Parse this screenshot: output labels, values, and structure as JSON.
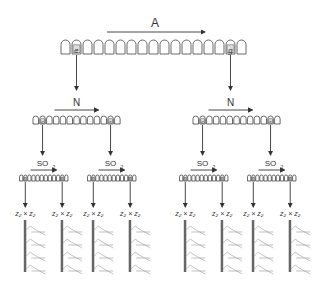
{
  "diagram": {
    "type": "hierarchical cleavage scheme",
    "levels": [
      {
        "id": "level-1",
        "enzyme_label": "A",
        "rows": [
          {
            "id": "top-row",
            "cell_count": 17,
            "marked_cells": [
              {
                "index": 1,
                "label": "e"
              },
              {
                "index": 15,
                "label": "g"
              }
            ]
          }
        ]
      },
      {
        "id": "level-2",
        "enzyme_label": "N",
        "rows": [
          {
            "id": "mid-left-row",
            "cell_count": 13,
            "marked_cells": [
              {
                "index": 1,
                "label": "e"
              },
              {
                "index": 11,
                "label": "e"
              }
            ]
          },
          {
            "id": "mid-right-row",
            "cell_count": 13,
            "marked_cells": [
              {
                "index": 1,
                "label": "e"
              },
              {
                "index": 11,
                "label": "e"
              }
            ]
          }
        ]
      },
      {
        "id": "level-3",
        "enzyme_label": "SO",
        "enzyme_subscript": "2",
        "rows": [
          {
            "id": "small-row-1",
            "cell_count": 12
          },
          {
            "id": "small-row-2",
            "cell_count": 12
          },
          {
            "id": "small-row-3",
            "cell_count": 12
          },
          {
            "id": "small-row-4",
            "cell_count": 12
          }
        ]
      }
    ],
    "products": [
      {
        "label": "z₂ × z₂"
      },
      {
        "label": "z₂ × z₂"
      },
      {
        "label": "z₂ × z₂"
      },
      {
        "label": "z₂ × z₂"
      },
      {
        "label": "z₂ × z₂"
      },
      {
        "label": "z₂ × z₂"
      },
      {
        "label": "z₂ × z₂"
      },
      {
        "label": "z₂ × z₂"
      }
    ]
  },
  "labels": {
    "A": "A",
    "N": "N",
    "SO": "SO",
    "sub2": "2",
    "product": "z₂ × z₂",
    "mark_e": "e",
    "mark_g": "g"
  }
}
